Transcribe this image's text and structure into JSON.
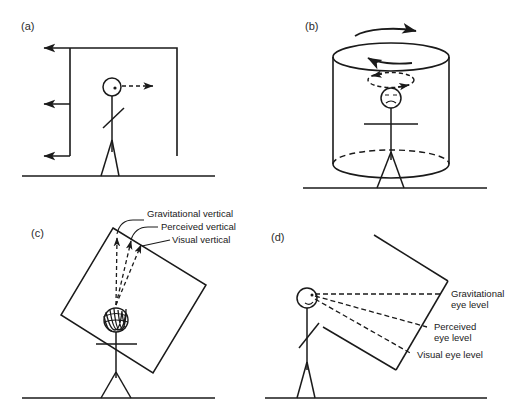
{
  "figure": {
    "stroke_color": "#1a1a1a",
    "background_color": "#ffffff",
    "width": 519,
    "height": 416
  },
  "panels": [
    {
      "id": "a",
      "label": "(a)",
      "description": "Stick figure inside an upright rectangular frame moving leftward; perceived self-motion to the right",
      "scene_arrows": {
        "frame_motion_count": 3,
        "frame_motion_direction": "left",
        "self_motion_direction": "right",
        "self_motion_style": "dashed"
      },
      "labels": []
    },
    {
      "id": "b",
      "label": "(b)",
      "description": "Stick figure with dizzy face inside a rotating cylinder (optokinetic drum)",
      "scene_arrows": {
        "drum_rotation_direction": "clockwise",
        "self_rotation_direction": "counter-clockwise",
        "self_rotation_style": "dashed"
      },
      "labels": []
    },
    {
      "id": "c",
      "label": "(c)",
      "description": "Stick figure inside a tilted room; three vertical reference directions",
      "labels": [
        {
          "key": "gravitational_vertical",
          "text": "Gravitational vertical"
        },
        {
          "key": "perceived_vertical",
          "text": "Perceived vertical"
        },
        {
          "key": "visual_vertical",
          "text": "Visual vertical"
        }
      ]
    },
    {
      "id": "d",
      "label": "(d)",
      "description": "Stick figure viewing a pitched corridor; three eye-level reference directions",
      "labels": [
        {
          "key": "gravitational_eye_level",
          "line1": "Gravitational",
          "line2": "eye level"
        },
        {
          "key": "perceived_eye_level",
          "line1": "Perceived",
          "line2": "eye level"
        },
        {
          "key": "visual_eye_level",
          "line1": "Visual eye level",
          "line2": ""
        }
      ]
    }
  ]
}
